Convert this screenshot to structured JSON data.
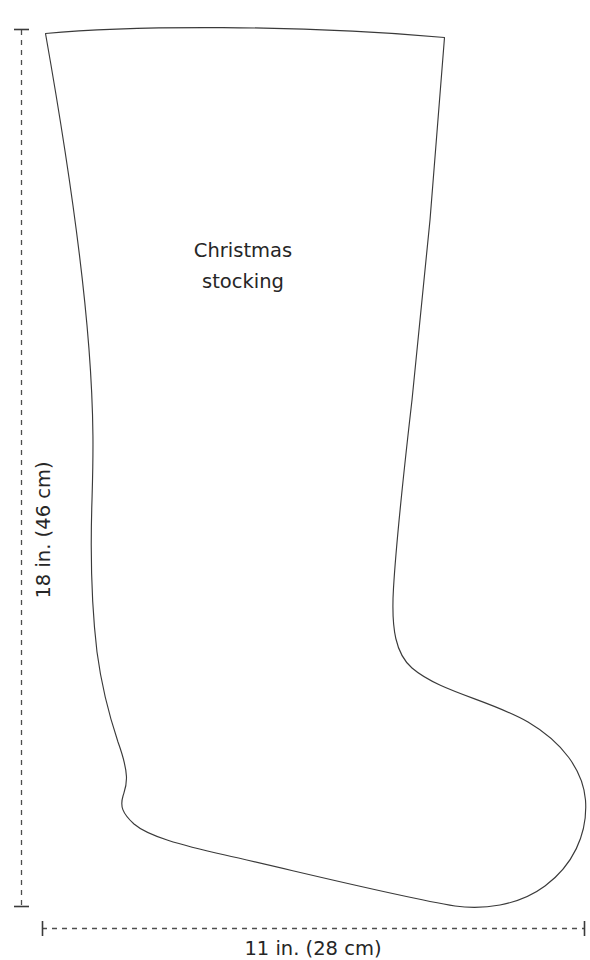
{
  "diagram": {
    "type": "sewing-pattern-outline",
    "background_color": "#ffffff",
    "outline_color": "#3a3a3a",
    "dimension_line_color": "#4d4d4d",
    "text_color": "#262626",
    "shape_label": {
      "line1": "Christmas",
      "line2": "stocking"
    },
    "dimensions": {
      "height_label": "18 in. (46 cm)",
      "width_label": "11 in. (28 cm)",
      "height_value_in": 18,
      "height_value_cm": 46,
      "width_value_in": 11,
      "width_value_cm": 28
    },
    "outline_path": "M45.5,33.5 C130,25.5 300,24.5 444.5,37.5 L430,220 L412,400 C404,470 397,530 393.5,588 C391,630 396,654 412,668 C440,692 490,700 528,722 C562,742 583,770 585.5,800 C588,835 572,866 545,886 C518,906 482,910 455,906 C400,897 300,872 225,855 C180,845 148,836 134,824 C122,813 120,806 123,796 C126,786 131,778 118,742 C110,718 102,690 97,652 C92,610 90,560 92,500 C94,430 98,330 45.5,33.5 Z"
  }
}
